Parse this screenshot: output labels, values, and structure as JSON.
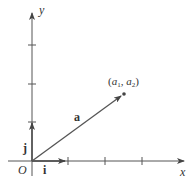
{
  "diagram": {
    "axes": {
      "x_label": "x",
      "y_label": "y",
      "origin_label": "O"
    },
    "unit_vectors": {
      "i_label": "i",
      "j_label": "j"
    },
    "vector": {
      "label": "a",
      "endpoint_label_prefix": "(",
      "endpoint_a": "a",
      "endpoint_sub1": "1",
      "endpoint_sep": ", ",
      "endpoint_sub2": "2",
      "endpoint_label_suffix": ")"
    },
    "colors": {
      "axis": "#555555",
      "vector": "#555555",
      "text": "#333333"
    }
  }
}
